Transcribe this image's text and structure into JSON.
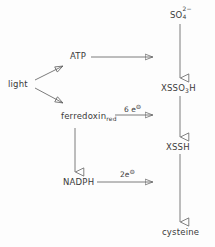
{
  "diagram": {
    "stroke_color": "#5a5a5a",
    "text_color": "#3a3a3a",
    "background": "#fdfdfd",
    "nodes": [
      {
        "id": "sulfate",
        "label": "SO",
        "sub": "4",
        "sup": "2−",
        "x": 170,
        "y": 9,
        "name": "node-sulfate"
      },
      {
        "id": "atp",
        "label": "ATP",
        "x": 70,
        "y": 52,
        "name": "node-atp"
      },
      {
        "id": "light",
        "label": "light",
        "x": 8,
        "y": 80,
        "name": "node-light"
      },
      {
        "id": "xsso3h",
        "label": "XSSO",
        "sub": "3",
        "tail": "H",
        "x": 161,
        "y": 84,
        "name": "node-xsso3h"
      },
      {
        "id": "ferredoxin",
        "label": "ferredoxin",
        "sub": "red",
        "x": 61,
        "y": 112,
        "name": "node-ferredoxin-red"
      },
      {
        "id": "xssh",
        "label": "XSSH",
        "x": 166,
        "y": 143,
        "name": "node-xssh"
      },
      {
        "id": "nadph",
        "label": "NADPH",
        "x": 63,
        "y": 178,
        "name": "node-nadph"
      },
      {
        "id": "cysteine",
        "label": "cysteine",
        "x": 162,
        "y": 228,
        "name": "node-cysteine"
      }
    ],
    "edge_labels": [
      {
        "id": "six-electrons",
        "number": "6",
        "symbol": "e",
        "charge": "⊖",
        "x": 124,
        "y": 104,
        "name": "edge-label-six-electrons"
      },
      {
        "id": "two-electrons",
        "number": "2",
        "symbol": "e",
        "charge": "⊖",
        "x": 120,
        "y": 169,
        "name": "edge-label-two-electrons"
      }
    ],
    "edges": [
      {
        "id": "light-to-atp",
        "from": "light",
        "to": "atp",
        "kind": "diagonal-up",
        "name": "arrow-light-to-atp"
      },
      {
        "id": "light-to-ferredoxin",
        "from": "light",
        "to": "ferredoxin",
        "kind": "diagonal-down",
        "name": "arrow-light-to-ferredoxin"
      },
      {
        "id": "atp-to-sulfate-branch",
        "from": "atp",
        "to": "vertical-right-upper",
        "kind": "horizontal",
        "name": "arrow-atp-to-pathway"
      },
      {
        "id": "ferredoxin-to-xsso3h",
        "from": "ferredoxin",
        "to": "vertical-right-mid",
        "kind": "horizontal",
        "name": "arrow-ferredoxin-to-pathway"
      },
      {
        "id": "nadph-to-xssh",
        "from": "nadph",
        "to": "vertical-right-lower",
        "kind": "horizontal",
        "name": "arrow-nadph-to-pathway"
      },
      {
        "id": "ferredoxin-to-nadph",
        "from": "ferredoxin",
        "to": "nadph",
        "kind": "vertical",
        "name": "arrow-ferredoxin-to-nadph"
      },
      {
        "id": "sulfate-to-xsso3h",
        "from": "sulfate",
        "to": "xsso3h",
        "kind": "vertical",
        "name": "arrow-sulfate-to-xsso3h"
      },
      {
        "id": "xsso3h-to-xssh",
        "from": "xsso3h",
        "to": "xssh",
        "kind": "vertical",
        "name": "arrow-xsso3h-to-xssh"
      },
      {
        "id": "xssh-to-cysteine",
        "from": "xssh",
        "to": "cysteine",
        "kind": "vertical",
        "name": "arrow-xssh-to-cysteine"
      }
    ]
  }
}
